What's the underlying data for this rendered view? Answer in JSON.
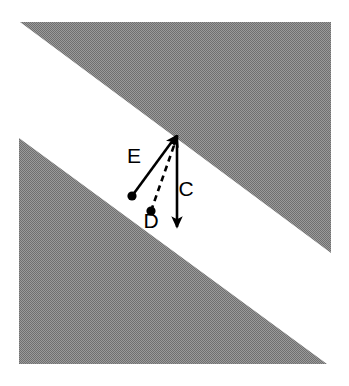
{
  "figure": {
    "canvas": {
      "width": 349,
      "height": 386,
      "background": "#ffffff"
    },
    "shading": {
      "fill": "#8a8a8a",
      "pattern": "halftone-dither",
      "regions": [
        {
          "name": "upper-right-triangle",
          "points": "20,22 331,22 331,253"
        },
        {
          "name": "lower-left-triangle",
          "points": "19,138 19,364 327,364"
        }
      ]
    },
    "apex": {
      "x": 178,
      "y": 134
    },
    "vectors": [
      {
        "id": "E",
        "label": "E",
        "style": "solid",
        "color": "#000000",
        "tail": {
          "x": 132,
          "y": 196
        },
        "head": {
          "x": 176,
          "y": 136
        },
        "tail_marker": "filled-dot",
        "head_marker": "arrowhead",
        "label_pos": {
          "x": 134,
          "y": 157
        }
      },
      {
        "id": "D",
        "label": "D",
        "style": "dashed",
        "color": "#000000",
        "tail": {
          "x": 151,
          "y": 211
        },
        "head": {
          "x": 177,
          "y": 137
        },
        "tail_marker": "filled-dot",
        "head_marker": "arrowhead",
        "label_pos": {
          "x": 151,
          "y": 222
        }
      },
      {
        "id": "C",
        "label": "C",
        "style": "solid",
        "color": "#000000",
        "tail": {
          "x": 177,
          "y": 135
        },
        "head": {
          "x": 177,
          "y": 227
        },
        "tail_marker": "none",
        "head_marker": "arrowhead",
        "label_pos": {
          "x": 186,
          "y": 190
        }
      }
    ]
  }
}
